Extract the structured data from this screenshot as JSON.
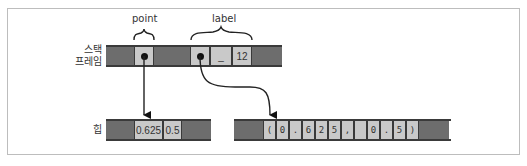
{
  "labels": {
    "stack_frame_line1": "스택",
    "stack_frame_line2": "프레임",
    "heap": "힙"
  },
  "variables": {
    "point": "point",
    "label": "label"
  },
  "stack_cells": {
    "label_len_placeholder": "_",
    "label_len": "12"
  },
  "heap_point": {
    "x": "0.625",
    "y": "0.5"
  },
  "heap_label_chars": [
    "(",
    "0",
    ".",
    "6",
    "2",
    "5",
    ",",
    " ",
    "0",
    ".",
    "5",
    ")"
  ]
}
